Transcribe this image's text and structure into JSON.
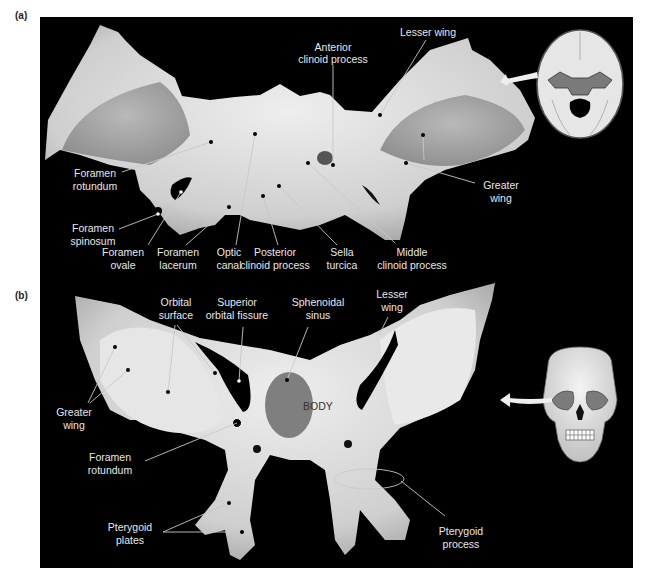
{
  "figure": {
    "background_color": "#000000",
    "bone_color": "#d9d9d9",
    "label_color": "#e8e8e8",
    "leader_color": "#bfbfbf"
  },
  "panel_a": {
    "letter": "(a)",
    "labels": {
      "anterior_clinoid_1": "Anterior",
      "anterior_clinoid_2": "clinoid process",
      "lesser_wing": "Lesser wing",
      "foramen_rotundum_1": "Foramen",
      "foramen_rotundum_2": "rotundum",
      "foramen_spinosum_1": "Foramen",
      "foramen_spinosum_2": "spinosum",
      "foramen_ovale_1": "Foramen",
      "foramen_ovale_2": "ovale",
      "foramen_lacerum_1": "Foramen",
      "foramen_lacerum_2": "lacerum",
      "optic_canal_1": "Optic",
      "optic_canal_2": "canal",
      "posterior_clinoid_1": "Posterior",
      "posterior_clinoid_2": "clinoid process",
      "sella_turcica_1": "Sella",
      "sella_turcica_2": "turcica",
      "middle_clinoid_1": "Middle",
      "middle_clinoid_2": "clinoid process",
      "greater_wing_1": "Greater",
      "greater_wing_2": "wing"
    },
    "inset": "skull-floor-superior-view"
  },
  "panel_b": {
    "letter": "(b)",
    "labels": {
      "orbital_surface_1": "Orbital",
      "orbital_surface_2": "surface",
      "superior_orbital_fissure_1": "Superior",
      "superior_orbital_fissure_2": "orbital fissure",
      "sphenoidal_sinus_1": "Sphenoidal",
      "sphenoidal_sinus_2": "sinus",
      "lesser_wing_1": "Lesser",
      "lesser_wing_2": "wing",
      "greater_wing_1": "Greater",
      "greater_wing_2": "wing",
      "body": "BODY",
      "foramen_rotundum_1": "Foramen",
      "foramen_rotundum_2": "rotundum",
      "pterygoid_plates_1": "Pterygoid",
      "pterygoid_plates_2": "plates",
      "pterygoid_process_1": "Pterygoid",
      "pterygoid_process_2": "process"
    },
    "inset": "skull-anterior-view"
  }
}
